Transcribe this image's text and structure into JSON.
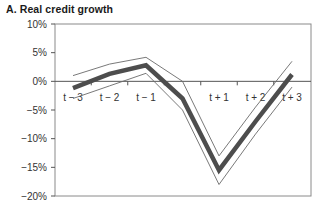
{
  "chart_data": {
    "type": "line",
    "title": "A.  Real credit growth",
    "xlabel": "",
    "ylabel": "",
    "categories": [
      "t − 3",
      "t − 2",
      "t − 1",
      "t",
      "t + 1",
      "t + 2",
      "t + 3"
    ],
    "x_labels_shown": [
      "t − 3",
      "t − 2",
      "t − 1",
      "",
      "t + 1",
      "t + 2",
      "t + 3"
    ],
    "yticks": [
      "10%",
      "5%",
      "0%",
      "−5%",
      "−10%",
      "−15%",
      "−20%"
    ],
    "ylim": [
      -20,
      10
    ],
    "grid": false,
    "legend": null,
    "series": [
      {
        "name": "Mean",
        "style": "thick",
        "color": "#555555",
        "values": [
          -1.2,
          1.3,
          2.8,
          -3.0,
          -15.5,
          -7.0,
          1.2
        ]
      },
      {
        "name": "Upper band",
        "style": "thin",
        "color": "#555555",
        "values": [
          1.0,
          3.0,
          4.2,
          0.0,
          -13.0,
          -4.5,
          3.5
        ]
      },
      {
        "name": "Lower band",
        "style": "thin",
        "color": "#555555",
        "values": [
          -3.0,
          -0.8,
          1.4,
          -5.0,
          -18.0,
          -9.2,
          -1.0
        ]
      }
    ]
  }
}
